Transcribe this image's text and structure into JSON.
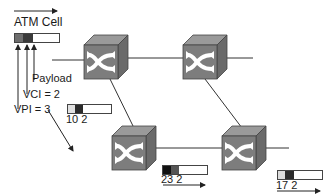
{
  "diagram": {
    "type": "network",
    "title_label": "ATM Cell",
    "header_labels": {
      "payload": "Payload",
      "vci": "VCI = 2",
      "vpi": "VPI = 3"
    },
    "cells": [
      {
        "id": "source",
        "label": "",
        "segments": [
          "#6e6e6e",
          "#3a3a3a",
          "#ffffff"
        ]
      },
      {
        "id": "hop1",
        "label": "10 2",
        "segments": [
          "#e0e0e0",
          "#2b2b2b",
          "#ffffff"
        ]
      },
      {
        "id": "hop2",
        "label": "23 2",
        "segments": [
          "#111111",
          "#555555",
          "#ffffff"
        ]
      },
      {
        "id": "hop3",
        "label": "17 2",
        "segments": [
          "#dcdcdc",
          "#2b2b2b",
          "#ffffff"
        ]
      }
    ],
    "nodes": [
      {
        "id": "switch-1",
        "type": "atm-switch"
      },
      {
        "id": "switch-2",
        "type": "atm-switch"
      },
      {
        "id": "switch-3",
        "type": "atm-switch"
      },
      {
        "id": "switch-4",
        "type": "atm-switch"
      }
    ],
    "edges": [
      [
        "input",
        "switch-1"
      ],
      [
        "switch-1",
        "switch-2"
      ],
      [
        "switch-2",
        "output-right"
      ],
      [
        "switch-1",
        "switch-3"
      ],
      [
        "switch-2",
        "switch-4"
      ],
      [
        "switch-3",
        "switch-4"
      ],
      [
        "switch-4",
        "output"
      ]
    ],
    "colors": {
      "switch_front": "#7d7d7d",
      "switch_top": "#9a9a9a",
      "switch_side": "#6a6a6a",
      "switch_symbol": "#ffffff",
      "line": "#333333"
    }
  }
}
